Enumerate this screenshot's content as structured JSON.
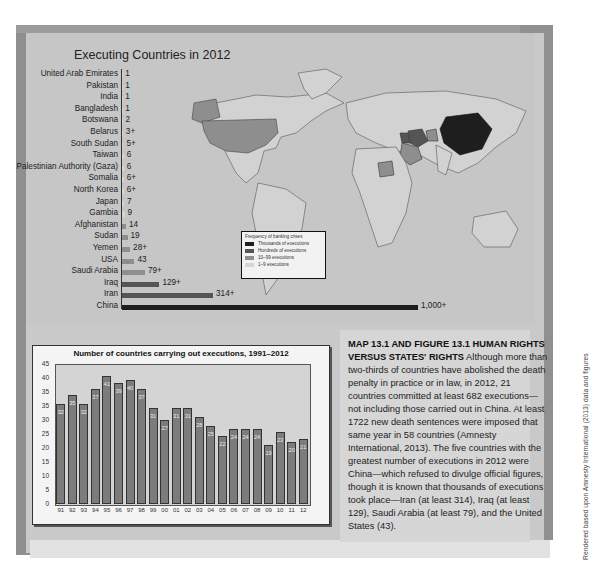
{
  "map": {
    "title": "Executing Countries in 2012",
    "legend": {
      "title": "Frequency of banking crises",
      "items": [
        {
          "label": "Thousands of executions",
          "color": "#1e1e1e"
        },
        {
          "label": "Hundreds of executions",
          "color": "#555555"
        },
        {
          "label": "10–99 executions",
          "color": "#8e8e8e"
        },
        {
          "label": "1–9 executions",
          "color": "#d6d6d6"
        }
      ]
    }
  },
  "chart_data": [
    {
      "type": "bar",
      "orientation": "horizontal",
      "title": "Executing Countries in 2012",
      "categories": [
        "United Arab Emirates",
        "Pakistan",
        "India",
        "Bangladesh",
        "Botswana",
        "Belarus",
        "South Sudan",
        "Taiwan",
        "Palestinian Authority (Gaza)",
        "Somalia",
        "North Korea",
        "Japan",
        "Gambia",
        "Afghanistan",
        "Sudan",
        "Yemen",
        "USA",
        "Saudi Arabia",
        "Iraq",
        "Iran",
        "China"
      ],
      "values": [
        1,
        1,
        1,
        1,
        2,
        3,
        5,
        6,
        6,
        6,
        6,
        7,
        9,
        14,
        19,
        28,
        43,
        79,
        129,
        314,
        1000
      ],
      "value_labels": [
        "1",
        "1",
        "1",
        "1",
        "2",
        "3+",
        "5+",
        "6",
        "6",
        "6+",
        "6+",
        "7",
        "9",
        "14",
        "19",
        "28+",
        "43",
        "79+",
        "129+",
        "314+",
        "1,000+"
      ]
    },
    {
      "type": "bar",
      "title": "Number of countries carrying out executions, 1991–2012",
      "categories": [
        "91",
        "92",
        "93",
        "94",
        "95",
        "96",
        "97",
        "98",
        "99",
        "00",
        "01",
        "02",
        "03",
        "04",
        "05",
        "06",
        "07",
        "08",
        "09",
        "10",
        "11",
        "12"
      ],
      "values": [
        32,
        35,
        32,
        37,
        41,
        39,
        40,
        37,
        31,
        27,
        31,
        31,
        28,
        25,
        22,
        24,
        24,
        24,
        19,
        23,
        20,
        21
      ],
      "yticks": [
        "0",
        "5",
        "10",
        "15",
        "20",
        "25",
        "30",
        "35",
        "35",
        "40",
        "45"
      ],
      "ylim": [
        0,
        45
      ],
      "xlabel": "",
      "ylabel": "",
      "grid": false
    }
  ],
  "caption": {
    "heading": "MAP 13.1 AND FIGURE 13.1    HUMAN RIGHTS VERSUS STATES' RIGHTS",
    "body": "Although more than two-thirds of countries have abolished the death penalty in practice or in law, in 2012, 21 countries committed at least 682 executions—not including those carried out in China. At least 1722 new death sentences were imposed that same year in 58 countries (Amnesty International, 2013). The five countries with the greatest number of executions in 2012 were China—which refused to divulge official figures, though it is known that thousands of executions took place—Iran (at least 314), Iraq (at least 129), Saudi Arabia (at least  79), and the United States (43)."
  },
  "credit": "Rendered based upon Amnesty International (2013) data and figures"
}
